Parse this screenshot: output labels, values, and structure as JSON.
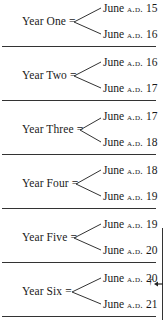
{
  "table": {
    "rows": [
      {
        "label": "Year One =",
        "top_date": {
          "month": "June",
          "era": "a.d.",
          "year": "15"
        },
        "bottom_date": {
          "month": "June",
          "era": "a.d.",
          "year": "16"
        }
      },
      {
        "label": "Year Two =",
        "top_date": {
          "month": "June",
          "era": "a.d.",
          "year": "16"
        },
        "bottom_date": {
          "month": "June",
          "era": "a.d.",
          "year": "17"
        }
      },
      {
        "label": "Year Three =",
        "top_date": {
          "month": "June",
          "era": "a.d.",
          "year": "17"
        },
        "bottom_date": {
          "month": "June",
          "era": "a.d.",
          "year": "18"
        }
      },
      {
        "label": "Year Four =",
        "top_date": {
          "month": "June",
          "era": "a.d.",
          "year": "18"
        },
        "bottom_date": {
          "month": "June",
          "era": "a.d.",
          "year": "19"
        }
      },
      {
        "label": "Year Five =",
        "top_date": {
          "month": "June",
          "era": "a.d.",
          "year": "19"
        },
        "bottom_date": {
          "month": "June",
          "era": "a.d.",
          "year": "20"
        }
      },
      {
        "label": "Year Six =",
        "top_date": {
          "month": "June",
          "era": "a.d.",
          "year": "20"
        },
        "bottom_date": {
          "month": "June",
          "era": "a.d.",
          "year": "21"
        }
      }
    ],
    "marker": {
      "symbol": "†",
      "icon": "left-arrow-icon"
    }
  },
  "colors": {
    "text": "#1a1a1a",
    "rule": "#333333",
    "background": "#ffffff"
  }
}
